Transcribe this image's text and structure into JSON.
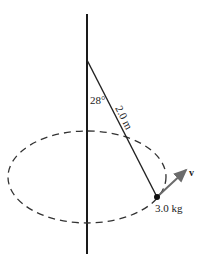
{
  "diagram": {
    "type": "conical-pendulum",
    "angle_label": "28°",
    "length_label": "2.0 m",
    "mass_label": "3.0 kg",
    "velocity_label": "v",
    "colors": {
      "pole": "#1a1a1a",
      "string": "#222222",
      "orbit": "#333333",
      "velocity_arrow": "#6b6b6b",
      "mass": "#111111"
    }
  }
}
